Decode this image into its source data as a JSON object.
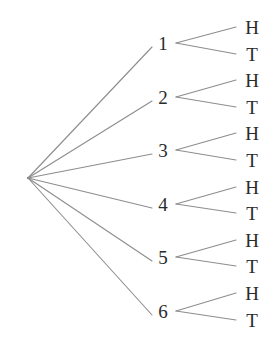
{
  "diagram": {
    "type": "probability-tree",
    "title": "",
    "root": {
      "label": "",
      "x": 28,
      "y": 178
    },
    "colors": {
      "background": "#ffffff",
      "line": "#8d8d8d",
      "text": "#2b2b2b"
    },
    "level1": {
      "name": "die-roll-outcomes",
      "label_x": 163,
      "branch_start_x": 176,
      "nodes": [
        {
          "label": "1",
          "y": 43
        },
        {
          "label": "2",
          "y": 97
        },
        {
          "label": "3",
          "y": 150
        },
        {
          "label": "4",
          "y": 204
        },
        {
          "label": "5",
          "y": 257
        },
        {
          "label": "6",
          "y": 311
        }
      ]
    },
    "level2": {
      "name": "coin-flip-outcomes",
      "label_x": 252,
      "branch_end_x": 236,
      "nodes": [
        {
          "label": "H",
          "y": 27,
          "parent": 0
        },
        {
          "label": "T",
          "y": 54,
          "parent": 0
        },
        {
          "label": "H",
          "y": 80,
          "parent": 1
        },
        {
          "label": "T",
          "y": 107,
          "parent": 1
        },
        {
          "label": "H",
          "y": 133,
          "parent": 2
        },
        {
          "label": "T",
          "y": 160,
          "parent": 2
        },
        {
          "label": "H",
          "y": 187,
          "parent": 3
        },
        {
          "label": "T",
          "y": 213,
          "parent": 3
        },
        {
          "label": "H",
          "y": 240,
          "parent": 4
        },
        {
          "label": "T",
          "y": 266,
          "parent": 4
        },
        {
          "label": "H",
          "y": 293,
          "parent": 5
        },
        {
          "label": "T",
          "y": 320,
          "parent": 5
        }
      ]
    }
  }
}
